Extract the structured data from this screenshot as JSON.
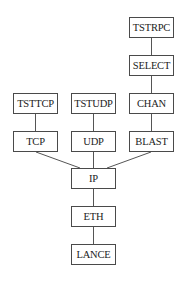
{
  "diagram": {
    "nodes": [
      {
        "id": "tstrpc",
        "label": "TSTRPC",
        "x": 129,
        "y": 17,
        "w": 45
      },
      {
        "id": "select",
        "label": "SELECT",
        "x": 129,
        "y": 55,
        "w": 45
      },
      {
        "id": "tsttcp",
        "label": "TSTTCP",
        "x": 13,
        "y": 93,
        "w": 45
      },
      {
        "id": "tstudp",
        "label": "TSTUDP",
        "x": 71,
        "y": 93,
        "w": 45
      },
      {
        "id": "chan",
        "label": "CHAN",
        "x": 129,
        "y": 93,
        "w": 45
      },
      {
        "id": "tcp",
        "label": "TCP",
        "x": 13,
        "y": 131,
        "w": 45
      },
      {
        "id": "udp",
        "label": "UDP",
        "x": 71,
        "y": 131,
        "w": 45
      },
      {
        "id": "blast",
        "label": "BLAST",
        "x": 129,
        "y": 131,
        "w": 45
      },
      {
        "id": "ip",
        "label": "IP",
        "x": 71,
        "y": 168,
        "w": 45
      },
      {
        "id": "eth",
        "label": "ETH",
        "x": 71,
        "y": 206,
        "w": 45
      },
      {
        "id": "lance",
        "label": "LANCE",
        "x": 71,
        "y": 244,
        "w": 45
      }
    ],
    "edges": [
      [
        "tstrpc",
        "select"
      ],
      [
        "select",
        "chan"
      ],
      [
        "chan",
        "blast"
      ],
      [
        "tsttcp",
        "tcp"
      ],
      [
        "tstudp",
        "udp"
      ],
      [
        "tcp",
        "ip"
      ],
      [
        "udp",
        "ip"
      ],
      [
        "blast",
        "ip"
      ],
      [
        "ip",
        "eth"
      ],
      [
        "eth",
        "lance"
      ]
    ],
    "colors": {
      "line": "#555555",
      "border": "#4a4a4a",
      "text": "#222222"
    }
  }
}
